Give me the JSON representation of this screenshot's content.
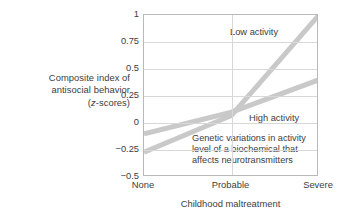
{
  "chart_data": {
    "type": "line",
    "title": "",
    "subtitle": "",
    "xlabel": "Childhood maltreatment",
    "ylabel": "Composite index of antisocial behavior (z-scores)",
    "ylabel_lines": [
      "Composite index of",
      "antisocial behavior",
      "(z-scores)"
    ],
    "ylabel_line3_italic_prefix": "z",
    "ylabel_line3_rest": "-scores)",
    "ylabel_line3_open": "(",
    "categories": [
      "None",
      "Probable",
      "Severe"
    ],
    "x": [
      0,
      1,
      2
    ],
    "ylim": [
      -0.5,
      1
    ],
    "yticks": [
      1,
      0.75,
      0.5,
      0.25,
      0,
      -0.25,
      -0.5
    ],
    "ytick_labels": [
      "1",
      "0.75",
      "0.5",
      "0.25",
      "0",
      "−0.25",
      "−0.5"
    ],
    "grid": true,
    "grid_color": "#d8d8d8",
    "frame_color": "#b9b9b9",
    "legend": "inline-labels",
    "series": [
      {
        "name": "Low activity",
        "values": [
          -0.27,
          0.07,
          1.0
        ],
        "color": "#c9c9c9",
        "label_text": "Low activity"
      },
      {
        "name": "High activity",
        "values": [
          -0.1,
          0.1,
          0.4
        ],
        "color": "#c9c9c9",
        "label_text": "High activity"
      }
    ],
    "annotations": [
      {
        "name": "gene-activity-note",
        "lines": [
          "Genetic variations in activity",
          "level of a biochemical that",
          "affects neurotransmitters"
        ]
      }
    ]
  },
  "colors": {
    "line": "#c9c9c9",
    "grid": "#d8d8d8",
    "frame": "#b9b9b9",
    "text": "#3d3d3d",
    "background": "#ffffff"
  }
}
